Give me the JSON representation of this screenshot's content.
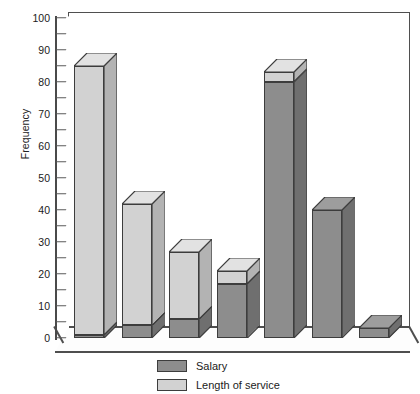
{
  "chart_data": {
    "type": "bar",
    "subtype": "stacked-column-3d",
    "title": "",
    "xlabel": "",
    "ylabel": "Frequency",
    "ylim": [
      0,
      100
    ],
    "ytick_step": 10,
    "yminor_step": 5,
    "grid": false,
    "legend_position": "bottom",
    "categories": [
      "1",
      "2",
      "3",
      "4",
      "5",
      "6",
      "7"
    ],
    "series": [
      {
        "name": "Salary",
        "color": "#8d8d8d",
        "values": [
          1,
          4,
          6,
          17,
          80,
          40,
          3
        ]
      },
      {
        "name": "Length of service",
        "color": "#d2d2d2",
        "values": [
          84,
          38,
          21,
          4,
          3,
          0,
          0
        ]
      }
    ],
    "totals": [
      85,
      42,
      27,
      21,
      83,
      40,
      3
    ],
    "yticks": [
      "0",
      "10",
      "20",
      "30",
      "40",
      "50",
      "60",
      "70",
      "80",
      "90",
      "100"
    ]
  },
  "legend": {
    "items": [
      {
        "label": "Salary",
        "swatch": "salary"
      },
      {
        "label": "Length of service",
        "swatch": "service"
      }
    ]
  },
  "axis": {
    "y_title": "Frequency"
  },
  "colors": {
    "salary": "#8d8d8d",
    "service": "#d2d2d2",
    "salary_side": "#6f6f6f",
    "service_side": "#b3b3b3",
    "outline": "#3d3d3d",
    "frame": "#4f4f4f",
    "background": "#ffffff"
  }
}
